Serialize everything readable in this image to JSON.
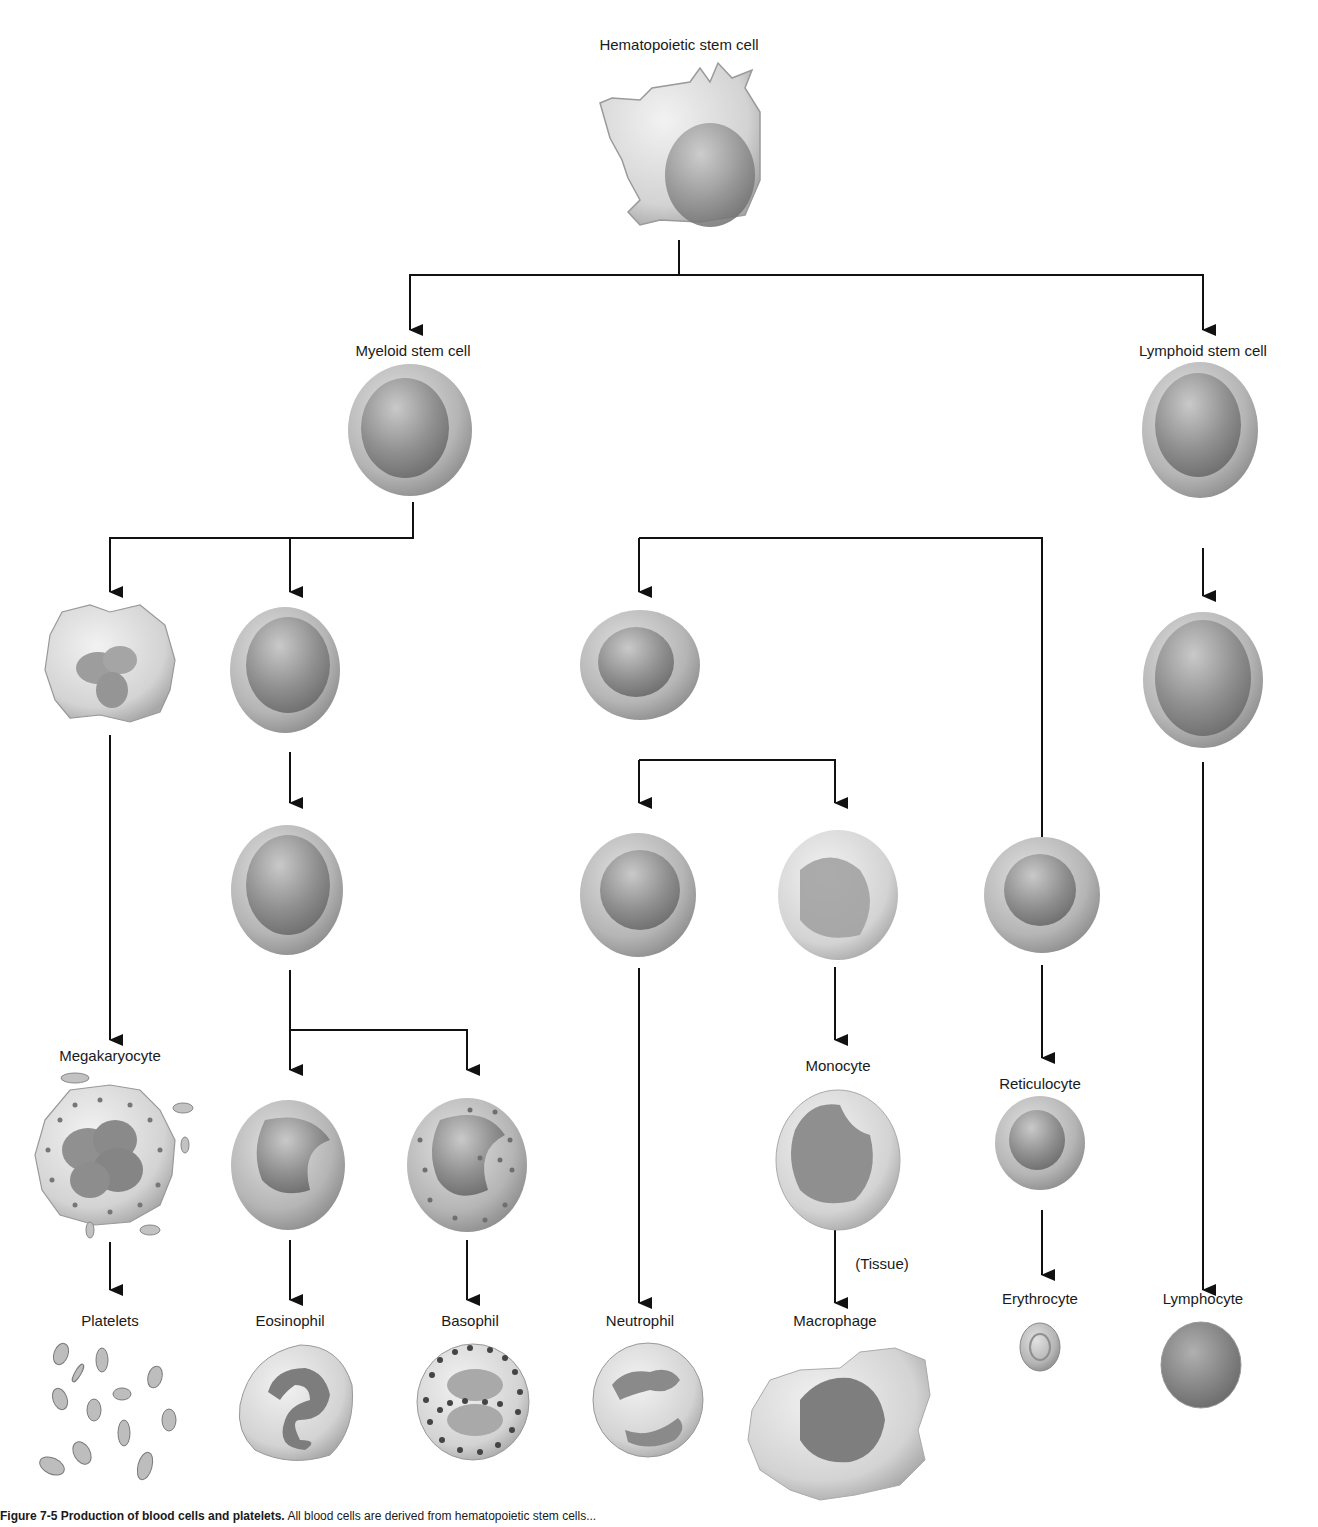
{
  "diagram": {
    "title": "Production of blood cells and platelets",
    "root": {
      "label": "Hematopoietic stem cell",
      "children": [
        {
          "label": "Myeloid stem cell",
          "children": [
            {
              "lineage": "megakaryocytic",
              "stages": [
                "Megakaryoblast (unlabeled)",
                "Megakaryocyte",
                "Platelets"
              ]
            },
            {
              "lineage": "granulocytic",
              "stages": [
                "Myeloblast (unlabeled)",
                "Promyelocyte (unlabeled)",
                "Eosinophilic myelocyte (unlabeled)",
                "Basophilic myelocyte (unlabeled)"
              ],
              "outputs": [
                "Eosinophil",
                "Basophil"
              ]
            },
            {
              "lineage": "myelomonocytic",
              "stages": [
                "Progenitor (unlabeled)",
                "Neutrophil precursor (unlabeled)",
                "Monoblast (unlabeled)"
              ],
              "outputs": [
                "Neutrophil",
                "Monocyte",
                "Macrophage"
              ],
              "annotation": "(Tissue)"
            },
            {
              "lineage": "erythroid",
              "stages": [
                "Erythroblast (unlabeled)",
                "Reticulocyte",
                "Erythrocyte"
              ]
            }
          ]
        },
        {
          "label": "Lymphoid stem cell",
          "children": [
            {
              "lineage": "lymphoid",
              "stages": [
                "Lymphoblast (unlabeled)",
                "Lymphocyte"
              ]
            }
          ]
        }
      ]
    }
  },
  "labels": {
    "hsc": "Hematopoietic stem cell",
    "myeloid": "Myeloid stem cell",
    "lymphoid": "Lymphoid stem cell",
    "megakaryocyte": "Megakaryocyte",
    "platelets": "Platelets",
    "eosinophil": "Eosinophil",
    "basophil": "Basophil",
    "neutrophil": "Neutrophil",
    "monocyte": "Monocyte",
    "tissue": "(Tissue)",
    "macrophage": "Macrophage",
    "reticulocyte": "Reticulocyte",
    "erythrocyte": "Erythrocyte",
    "lymphocyte": "Lymphocyte"
  },
  "caption": {
    "figure_label": "Figure 7-5 Production of blood cells and platelets.",
    "text": "All blood cells are derived from hematopoietic stem cells..."
  },
  "colors": {
    "line": "#111111",
    "cell_light": "#d8d8d8",
    "cell_mid": "#a9a9a9",
    "cell_dark": "#7a7a7a"
  }
}
